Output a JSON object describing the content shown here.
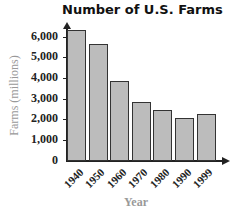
{
  "chart_data": {
    "type": "bar",
    "title": "Number of U.S. Farms",
    "xlabel": "Year",
    "ylabel": "Farms (millions)",
    "categories": [
      "1940",
      "1950",
      "1960",
      "1970",
      "1980",
      "1990",
      "1999"
    ],
    "values": [
      6350,
      5650,
      3850,
      2850,
      2450,
      2100,
      2250
    ],
    "yticks": [
      "0",
      "1,000",
      "2,000",
      "3,000",
      "4,000",
      "5,000",
      "6,000"
    ],
    "ylim": [
      0,
      6500
    ],
    "grid": false,
    "legend": null,
    "colors": {
      "bar_fill": "#bcbcbc",
      "bar_edge": "#333333",
      "axis_label": "#999999"
    }
  }
}
